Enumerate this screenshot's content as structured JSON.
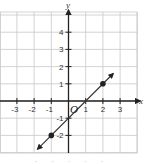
{
  "chart_data": {
    "type": "line",
    "title": "",
    "xlabel": "x",
    "ylabel": "y",
    "origin_label": "O",
    "xlim": [
      -4,
      4
    ],
    "ylim": [
      -3,
      5
    ],
    "grid": true,
    "x_ticks": [
      -3,
      -2,
      -1,
      1,
      2,
      3
    ],
    "y_ticks": [
      4,
      3,
      2,
      1,
      -1,
      -2
    ],
    "tick_labels": {
      "x": [
        "-3",
        "-2",
        "-1",
        "1",
        "2",
        "3"
      ],
      "y": [
        "4",
        "3",
        "2",
        "1",
        "-1",
        "-2"
      ]
    },
    "series": [
      {
        "name": "y = x - 1",
        "slope": 1,
        "intercept": -1,
        "line_endpoints": [
          [
            -1.8,
            -2.8
          ],
          [
            2.6,
            1.6
          ]
        ],
        "arrows_both_ends": true,
        "marked_points": [
          [
            -1,
            -2
          ],
          [
            2,
            1
          ]
        ]
      }
    ],
    "colors": {
      "grid": "#c8c8c8",
      "axis": "#222222",
      "line": "#333333"
    }
  }
}
